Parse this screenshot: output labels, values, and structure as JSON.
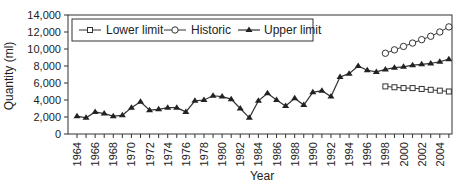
{
  "chart_data": {
    "type": "line",
    "title": "",
    "xlabel": "Year",
    "ylabel": "Quantity (ml)",
    "ylim": [
      0,
      14000
    ],
    "xlim": [
      1963,
      2005
    ],
    "y_ticks": [
      0,
      2000,
      4000,
      6000,
      8000,
      10000,
      12000,
      14000
    ],
    "y_tick_labels": [
      "0",
      "2,000",
      "4,000",
      "6,000",
      "8,000",
      "10,000",
      "12,000",
      "14,000"
    ],
    "x_tick_labels": [
      "1964",
      "1966",
      "1968",
      "1970",
      "1972",
      "1974",
      "1976",
      "1978",
      "1980",
      "1982",
      "1984",
      "1986",
      "1988",
      "1990",
      "1992",
      "1994",
      "1996",
      "1998",
      "2000",
      "2002",
      "2004"
    ],
    "grid": false,
    "legend_position": "top-left, inside plot, boxed",
    "series": [
      {
        "name": "Lower limit",
        "marker": "open-square",
        "x": [
          1998,
          1999,
          2000,
          2001,
          2002,
          2003,
          2004,
          2005
        ],
        "values": [
          5600,
          5500,
          5400,
          5400,
          5300,
          5200,
          5100,
          5000
        ]
      },
      {
        "name": "Historic",
        "marker": "open-circle",
        "x": [
          1998,
          1999,
          2000,
          2001,
          2002,
          2003,
          2004,
          2005
        ],
        "values": [
          9500,
          9900,
          10300,
          10700,
          11100,
          11500,
          12000,
          12600
        ]
      },
      {
        "name": "Upper limit",
        "marker": "filled-triangle",
        "x": [
          1964,
          1965,
          1966,
          1967,
          1968,
          1969,
          1970,
          1971,
          1972,
          1973,
          1974,
          1975,
          1976,
          1977,
          1978,
          1979,
          1980,
          1981,
          1982,
          1983,
          1984,
          1985,
          1986,
          1987,
          1988,
          1989,
          1990,
          1991,
          1992,
          1993,
          1994,
          1995,
          1996,
          1997,
          1998,
          1999,
          2000,
          2001,
          2002,
          2003,
          2004,
          2005
        ],
        "values": [
          2100,
          1900,
          2600,
          2400,
          2100,
          2200,
          3100,
          3800,
          2800,
          2900,
          3100,
          3100,
          2600,
          3900,
          4000,
          4500,
          4400,
          4100,
          3000,
          1900,
          3900,
          4800,
          4000,
          3300,
          4200,
          3400,
          4900,
          5100,
          4400,
          6700,
          7100,
          8000,
          7500,
          7300,
          7600,
          7800,
          7900,
          8100,
          8200,
          8300,
          8500,
          8800
        ]
      }
    ]
  },
  "legend": {
    "items": [
      {
        "label": "Lower limit"
      },
      {
        "label": "Historic"
      },
      {
        "label": "Upper limit"
      }
    ]
  },
  "axes": {
    "xlabel": "Year",
    "ylabel": "Quantity (ml)"
  }
}
